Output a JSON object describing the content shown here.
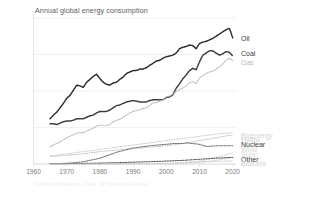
{
  "chart_data": {
    "type": "line",
    "title": "Annual global energy consumption",
    "xlabel": "",
    "ylabel": "",
    "yunit": "200 EJ",
    "ytick_labels": [
      "200 EJ",
      "150",
      "100",
      "50",
      "0"
    ],
    "ytick_values": [
      200,
      150,
      100,
      50,
      0
    ],
    "xtick_labels": [
      "1960",
      "1970",
      "1980",
      "1990",
      "2000",
      "2010",
      "2020"
    ],
    "xtick_values": [
      1960,
      1970,
      1980,
      1990,
      2000,
      2010,
      2020
    ],
    "xlim": [
      1960,
      2021
    ],
    "ylim": [
      0,
      200
    ],
    "grid": true,
    "grid_axis": "y",
    "legend_position": "right-of-plot-end-labels",
    "credit": "OurWorldInData.org • Data: BP Statistical Review",
    "series": [
      {
        "name": "Oil",
        "color": "#2b2b2b",
        "label_y_value": 172,
        "x": [
          1965,
          1966,
          1967,
          1968,
          1969,
          1970,
          1971,
          1972,
          1973,
          1974,
          1975,
          1976,
          1977,
          1978,
          1979,
          1980,
          1981,
          1982,
          1983,
          1984,
          1985,
          1986,
          1987,
          1988,
          1989,
          1990,
          1991,
          1992,
          1993,
          1994,
          1995,
          1996,
          1997,
          1998,
          1999,
          2000,
          2001,
          2002,
          2003,
          2004,
          2005,
          2006,
          2007,
          2008,
          2009,
          2010,
          2011,
          2012,
          2013,
          2014,
          2015,
          2016,
          2017,
          2018,
          2019,
          2020
        ],
        "values": [
          62,
          67,
          71,
          77,
          83,
          90,
          94,
          101,
          108,
          107,
          105,
          112,
          116,
          120,
          123,
          117,
          112,
          109,
          108,
          111,
          112,
          116,
          119,
          124,
          126,
          128,
          128,
          130,
          130,
          132,
          135,
          138,
          141,
          142,
          145,
          147,
          148,
          149,
          152,
          158,
          160,
          161,
          163,
          162,
          158,
          165,
          167,
          168,
          170,
          172,
          175,
          178,
          181,
          184,
          186,
          173
        ]
      },
      {
        "name": "Coal",
        "color": "#3a3a3a",
        "label_y_value": 152,
        "x": [
          1965,
          1966,
          1967,
          1968,
          1969,
          1970,
          1971,
          1972,
          1973,
          1974,
          1975,
          1976,
          1977,
          1978,
          1979,
          1980,
          1981,
          1982,
          1983,
          1984,
          1985,
          1986,
          1987,
          1988,
          1989,
          1990,
          1991,
          1992,
          1993,
          1994,
          1995,
          1996,
          1997,
          1998,
          1999,
          2000,
          2001,
          2002,
          2003,
          2004,
          2005,
          2006,
          2007,
          2008,
          2009,
          2010,
          2011,
          2012,
          2013,
          2014,
          2015,
          2016,
          2017,
          2018,
          2019,
          2020
        ],
        "values": [
          55,
          55,
          54,
          56,
          58,
          59,
          59,
          60,
          62,
          62,
          62,
          64,
          66,
          67,
          70,
          72,
          72,
          72,
          74,
          77,
          80,
          81,
          83,
          85,
          86,
          87,
          86,
          85,
          85,
          85,
          87,
          88,
          88,
          88,
          88,
          91,
          92,
          95,
          104,
          110,
          117,
          122,
          128,
          131,
          129,
          140,
          149,
          152,
          155,
          155,
          152,
          149,
          151,
          154,
          153,
          148
        ]
      },
      {
        "name": "Gas",
        "color": "#b9b9b7",
        "label_y_value": 140,
        "x": [
          1965,
          1966,
          1967,
          1968,
          1969,
          1970,
          1971,
          1972,
          1973,
          1974,
          1975,
          1976,
          1977,
          1978,
          1979,
          1980,
          1981,
          1982,
          1983,
          1984,
          1985,
          1986,
          1987,
          1988,
          1989,
          1990,
          1991,
          1992,
          1993,
          1994,
          1995,
          1996,
          1997,
          1998,
          1999,
          2000,
          2001,
          2002,
          2003,
          2004,
          2005,
          2006,
          2007,
          2008,
          2009,
          2010,
          2011,
          2012,
          2013,
          2014,
          2015,
          2016,
          2017,
          2018,
          2019,
          2020
        ],
        "values": [
          24,
          26,
          28,
          30,
          33,
          36,
          38,
          40,
          42,
          43,
          43,
          45,
          47,
          49,
          52,
          53,
          53,
          53,
          54,
          58,
          60,
          61,
          64,
          67,
          70,
          72,
          73,
          74,
          76,
          77,
          80,
          84,
          84,
          86,
          88,
          92,
          93,
          96,
          99,
          102,
          104,
          107,
          111,
          113,
          110,
          118,
          121,
          124,
          126,
          127,
          130,
          133,
          137,
          142,
          145,
          142
        ]
      },
      {
        "name": "Bioenergy",
        "color": "#d3d3d1",
        "label_y_value": 40,
        "x": [
          1965,
          1970,
          1975,
          1980,
          1985,
          1990,
          1995,
          2000,
          2005,
          2010,
          2015,
          2020
        ],
        "values": [
          11,
          14,
          17,
          20,
          23,
          26,
          29,
          32,
          35,
          38,
          41,
          43
        ]
      },
      {
        "name": "Hydro",
        "color": "#c9c9c7",
        "label_y_value": 34,
        "x": [
          1965,
          1970,
          1975,
          1980,
          1985,
          1990,
          1995,
          2000,
          2005,
          2010,
          2015,
          2020
        ],
        "values": [
          10,
          12,
          14,
          17,
          19,
          21,
          23,
          25,
          28,
          32,
          36,
          40
        ]
      },
      {
        "name": "Nuclear",
        "color": "#6f6f6d",
        "label_y_value": 27,
        "x": [
          1965,
          1970,
          1975,
          1980,
          1985,
          1990,
          1995,
          2000,
          2002,
          2005,
          2006,
          2010,
          2012,
          2015,
          2020
        ],
        "values": [
          0.2,
          1,
          3,
          8,
          16,
          22,
          25,
          27,
          28,
          28,
          29,
          27,
          24,
          25,
          25
        ]
      },
      {
        "name": "Wind",
        "color": "#d8d8d6",
        "label_y_value": 20,
        "x": [
          1965,
          1985,
          1990,
          1995,
          2000,
          2005,
          2010,
          2015,
          2020
        ],
        "values": [
          0,
          0,
          0.1,
          0.3,
          0.8,
          2,
          4,
          9,
          15
        ]
      },
      {
        "name": "Solar",
        "color": "#dcdcda",
        "label_y_value": 14,
        "x": [
          1965,
          1990,
          1995,
          2000,
          2005,
          2010,
          2015,
          2020
        ],
        "values": [
          0,
          0,
          0.05,
          0.1,
          0.4,
          2,
          5,
          9
        ]
      },
      {
        "name": "Other",
        "color": "#555553",
        "label_y_value": 7,
        "x": [
          1965,
          1970,
          1975,
          1980,
          1985,
          1990,
          1995,
          2000,
          2005,
          2010,
          2015,
          2020
        ],
        "values": [
          0.3,
          0.5,
          0.8,
          1.2,
          1.8,
          2.5,
          3.2,
          4,
          5,
          6.5,
          8,
          9
        ]
      },
      {
        "name": "Biofuels",
        "color": "#cfcfcd",
        "label_y_value": 1,
        "x": [
          1965,
          1980,
          1990,
          1995,
          2000,
          2005,
          2010,
          2015,
          2020
        ],
        "values": [
          0,
          0.1,
          0.3,
          0.5,
          0.8,
          1.5,
          3,
          3.8,
          4
        ]
      }
    ]
  }
}
